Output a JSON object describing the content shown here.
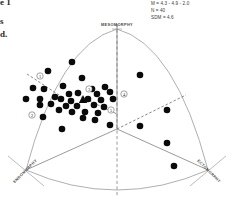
{
  "figure": {
    "type": "somatochart",
    "page_fragments": [
      {
        "id": "frag-1",
        "text": "e 1"
      },
      {
        "id": "frag-2",
        "text": "s"
      },
      {
        "id": "frag-3",
        "text": "d."
      }
    ]
  },
  "stats": {
    "lines": [
      "M = 4.3 - 4.9 - 2.0",
      "N = 40",
      "SDM = 4.6"
    ]
  },
  "axes": {
    "top": "MESOMORPHY",
    "bottom_left": "ENDOMORPHY",
    "bottom_right": "ECTOMORPHY"
  },
  "sector_tags": [
    {
      "label": "1",
      "x": 40,
      "y": 76
    },
    {
      "label": "2",
      "x": 32,
      "y": 115
    },
    {
      "label": "3",
      "x": 89,
      "y": 89
    },
    {
      "label": "4",
      "x": 124,
      "y": 94
    },
    {
      "label": "5",
      "x": 111,
      "y": 110
    }
  ],
  "chart_data": {
    "type": "scatter",
    "title": "",
    "xlabel": "",
    "ylabel": "",
    "legend": "",
    "grid": false,
    "n_points": 40,
    "mean_marker": {
      "shape": "triangle",
      "x": 83,
      "y": 100,
      "label": "M = 4.3 - 4.9 - 2.0"
    },
    "points": [
      {
        "x": 72,
        "y": 62
      },
      {
        "x": 48,
        "y": 71
      },
      {
        "x": 82,
        "y": 78
      },
      {
        "x": 140,
        "y": 75
      },
      {
        "x": 33,
        "y": 88
      },
      {
        "x": 44,
        "y": 89
      },
      {
        "x": 63,
        "y": 86
      },
      {
        "x": 92,
        "y": 89
      },
      {
        "x": 105,
        "y": 87
      },
      {
        "x": 26,
        "y": 99
      },
      {
        "x": 40,
        "y": 99
      },
      {
        "x": 55,
        "y": 97
      },
      {
        "x": 69,
        "y": 94
      },
      {
        "x": 78,
        "y": 93
      },
      {
        "x": 97,
        "y": 94
      },
      {
        "x": 110,
        "y": 92
      },
      {
        "x": 61,
        "y": 99
      },
      {
        "x": 71,
        "y": 101
      },
      {
        "x": 88,
        "y": 99
      },
      {
        "x": 101,
        "y": 100
      },
      {
        "x": 113,
        "y": 99
      },
      {
        "x": 40,
        "y": 105
      },
      {
        "x": 51,
        "y": 104
      },
      {
        "x": 66,
        "y": 106
      },
      {
        "x": 77,
        "y": 106
      },
      {
        "x": 94,
        "y": 105
      },
      {
        "x": 104,
        "y": 107
      },
      {
        "x": 59,
        "y": 110
      },
      {
        "x": 72,
        "y": 112
      },
      {
        "x": 85,
        "y": 112
      },
      {
        "x": 98,
        "y": 113
      },
      {
        "x": 43,
        "y": 117
      },
      {
        "x": 83,
        "y": 118
      },
      {
        "x": 95,
        "y": 120
      },
      {
        "x": 110,
        "y": 125
      },
      {
        "x": 62,
        "y": 129
      },
      {
        "x": 167,
        "y": 110
      },
      {
        "x": 140,
        "y": 126
      },
      {
        "x": 167,
        "y": 143
      },
      {
        "x": 174,
        "y": 166
      }
    ]
  },
  "colors": {
    "point": "#0a0a0a",
    "outline": "#8d8d8d",
    "divider": "#6f6f6f",
    "dashed": "#3b3b3b",
    "text": "#3a3a3a",
    "background": "#ffffff"
  }
}
